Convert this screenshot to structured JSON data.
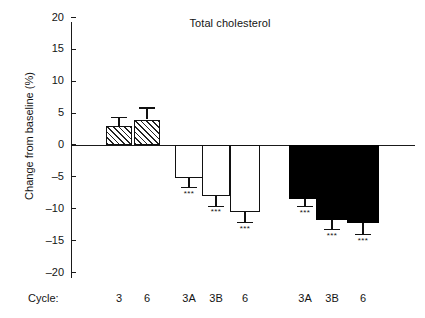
{
  "chart_data": {
    "type": "bar",
    "title": "Total cholesterol",
    "xlabel": "Cycle:",
    "ylabel": "Change from baseline (%)",
    "ylim": [
      -20,
      20
    ],
    "ytick_labels": [
      "20",
      "15",
      "10",
      "5",
      "0",
      "-5",
      "-10",
      "-15",
      "-20"
    ],
    "yticks": [
      20,
      15,
      10,
      5,
      0,
      -5,
      -10,
      -15,
      -20
    ],
    "grid": false,
    "legend": "none",
    "categories": [
      "3",
      "6",
      "3A",
      "3B",
      "6",
      "3A",
      "3B",
      "6"
    ],
    "groups": [
      {
        "name": "hatched",
        "fill": "hatched",
        "categories": [
          "3",
          "6"
        ],
        "values": [
          3.0,
          4.0
        ],
        "errors": [
          1.3,
          1.8
        ],
        "significance": [
          "",
          ""
        ]
      },
      {
        "name": "open",
        "fill": "open",
        "categories": [
          "3A",
          "3B",
          "6"
        ],
        "values": [
          -5.2,
          -8.0,
          -10.5
        ],
        "errors": [
          1.5,
          1.6,
          1.7
        ],
        "significance": [
          "***",
          "***",
          "***"
        ]
      },
      {
        "name": "solid",
        "fill": "solid",
        "categories": [
          "3A",
          "3B",
          "6"
        ],
        "values": [
          -8.5,
          -11.8,
          -12.2
        ],
        "errors": [
          1.2,
          1.5,
          1.9
        ],
        "significance": [
          "***",
          "***",
          "***"
        ]
      }
    ],
    "values": [
      3.0,
      4.0,
      -5.2,
      -8.0,
      -10.5,
      -8.5,
      -11.8,
      -12.2
    ],
    "errors": [
      1.3,
      1.8,
      1.5,
      1.6,
      1.7,
      1.2,
      1.5,
      1.9
    ],
    "significance": [
      "",
      "",
      "***",
      "***",
      "***",
      "***",
      "***",
      "***"
    ],
    "colors": {
      "axis": "#1a1a1a",
      "hatched_fill": "#ffffff",
      "hatched_stroke": "#111111",
      "open_fill": "#ffffff",
      "open_stroke": "#111111",
      "solid_fill": "#000000",
      "solid_stroke": "#000000",
      "background": "#ffffff",
      "text": "#141414"
    }
  }
}
